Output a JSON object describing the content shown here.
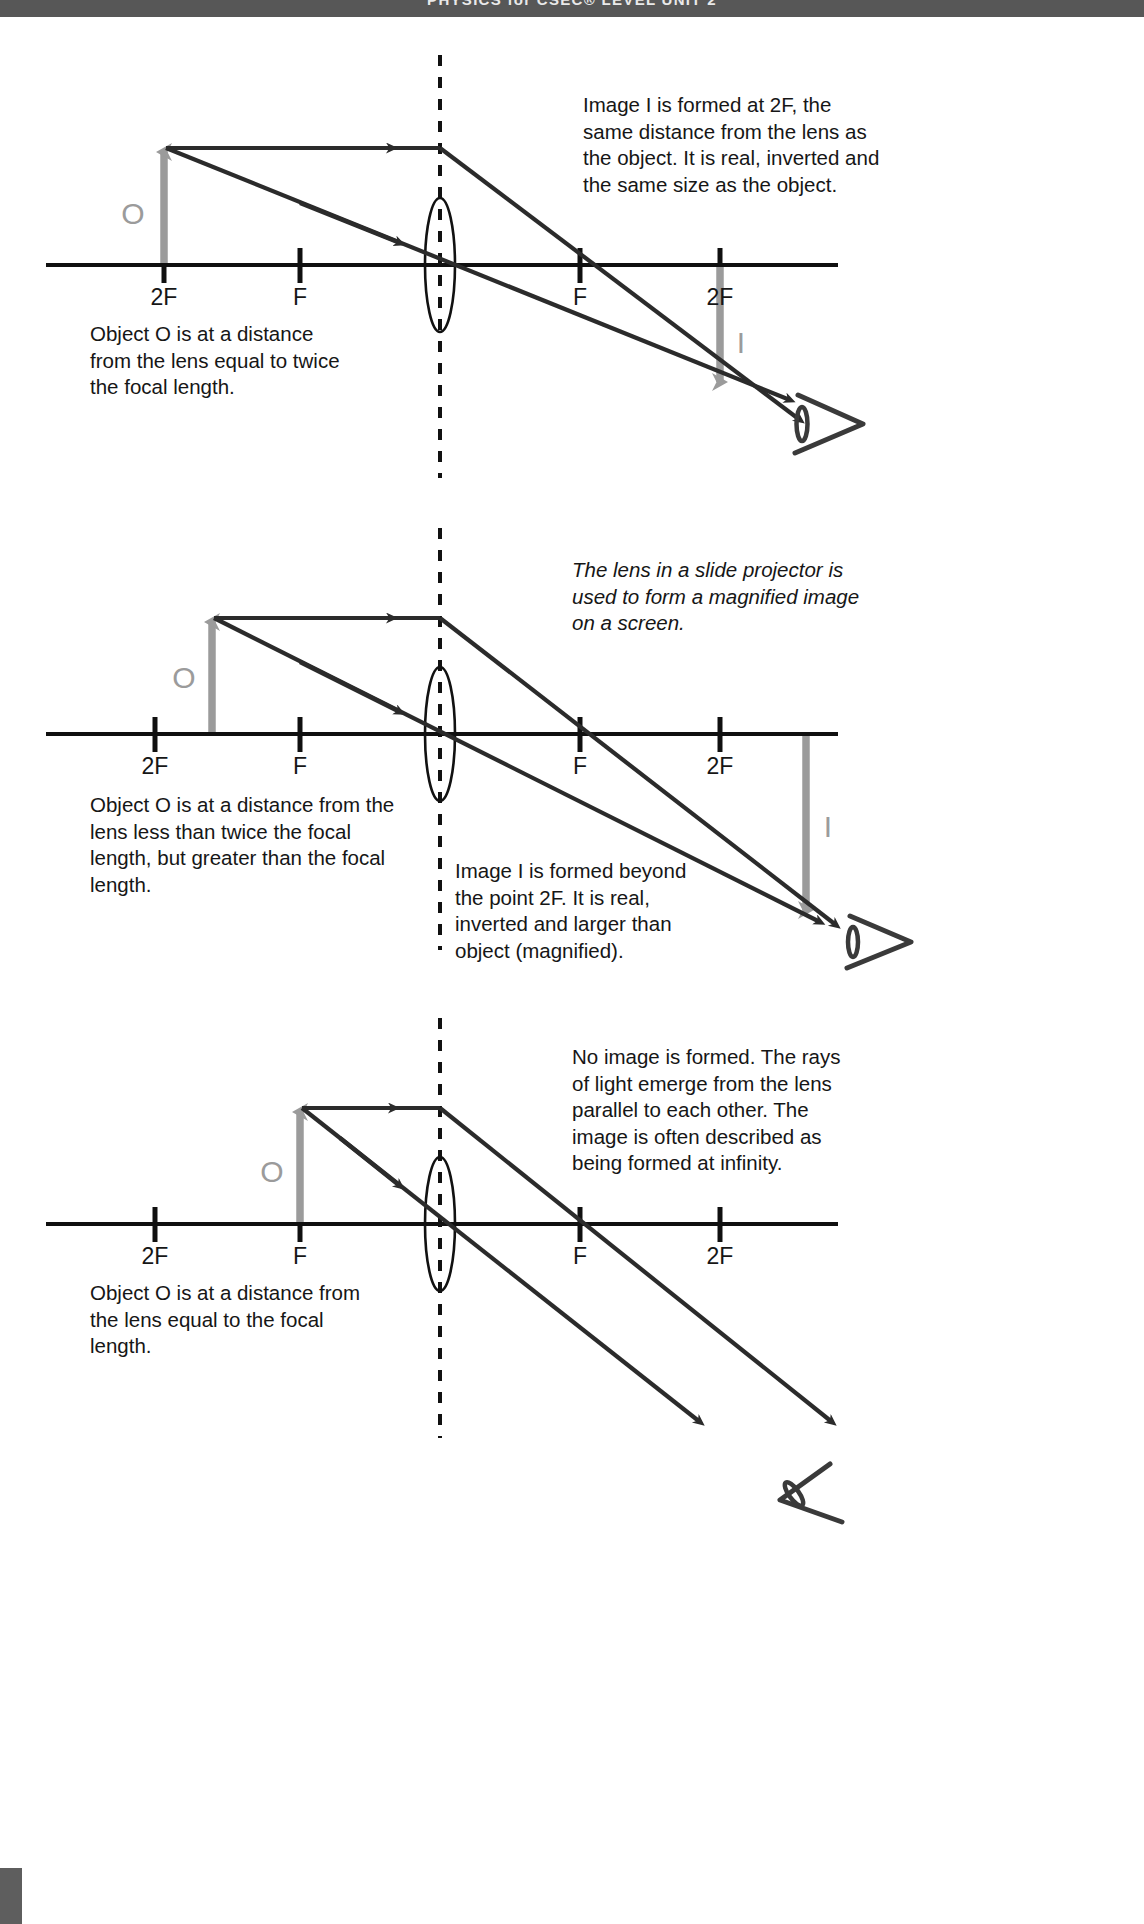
{
  "page": {
    "header_text": "PHYSICS for CSEC® LEVEL     UNIT 2",
    "axis_color": "#101010",
    "ray_color": "#2b2b2b",
    "object_color": "#9b9b9b",
    "text_color": "#161616",
    "header_bg": "#575757"
  },
  "labels": {
    "point_2f": "2F",
    "point_f": "F",
    "object": "O",
    "image": "I"
  },
  "diagrams": [
    {
      "id": "object-at-2f",
      "axis_labels": [
        "2F",
        "F",
        "F",
        "2F"
      ],
      "object_label": "O",
      "image_label": "I",
      "note_right": "Image I is formed at 2F,  the same distance from the lens as the object. It is real, inverted and the same size as the object.",
      "note_left": "Object O is at a distance from the lens equal to  twice the focal length.",
      "note_right_style": "normal",
      "has_image_arrow": true,
      "has_eye": true
    },
    {
      "id": "object-between-f-and-2f",
      "axis_labels": [
        "2F",
        "F",
        "F",
        "2F"
      ],
      "object_label": "O",
      "image_label": "I",
      "note_right": "The lens in a slide projector is used to form a magnified image on a screen.",
      "note_left": "Object O is at a distance from the lens less than twice the focal length, but greater than the focal length.",
      "note_bottom": "Image I is formed beyond the point 2F. It is real, inverted and larger than object (magnified).",
      "note_right_style": "italic",
      "has_image_arrow": true,
      "has_eye": true
    },
    {
      "id": "object-at-f",
      "axis_labels": [
        "2F",
        "F",
        "F",
        "2F"
      ],
      "object_label": "O",
      "note_right": "No image is formed. The rays of light emerge from the lens parallel to each other. The image is often described as being formed at infinity.",
      "note_left": "Object O is at a distance from the lens equal to the focal length.",
      "note_right_style": "normal",
      "has_image_arrow": false,
      "has_eye": true
    }
  ]
}
